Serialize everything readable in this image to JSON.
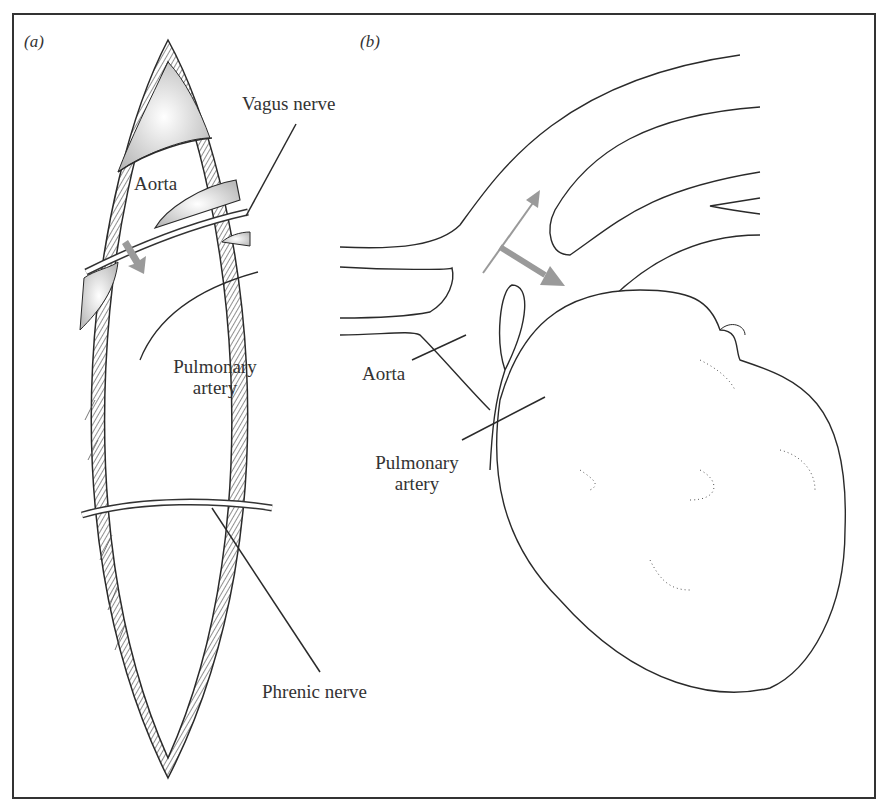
{
  "figure": {
    "panels": [
      {
        "id": "a",
        "label": "(a)"
      },
      {
        "id": "b",
        "label": "(b)"
      }
    ],
    "panel_a_labels": {
      "vagus_nerve": "Vagus nerve",
      "aorta": "Aorta",
      "pulmonary_artery_line1": "Pulmonary",
      "pulmonary_artery_line2": "artery",
      "phrenic_nerve": "Phrenic nerve"
    },
    "panel_b_labels": {
      "aorta": "Aorta",
      "pulmonary_artery_line1": "Pulmonary",
      "pulmonary_artery_line2": "artery"
    },
    "colors": {
      "line": "#2a2a2a",
      "arrow": "#9a9a9a",
      "background": "#ffffff"
    }
  }
}
